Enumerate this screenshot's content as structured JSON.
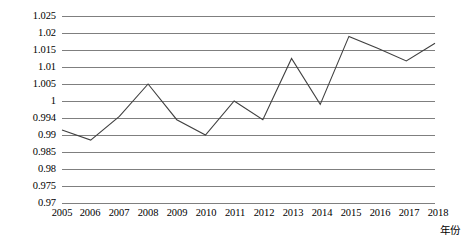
{
  "chart_data": {
    "type": "line",
    "title": "",
    "subtitle": "",
    "xlabel": "年份",
    "ylabel": "",
    "grid": true,
    "legend": false,
    "legend_position": "none",
    "line_color": "#404040",
    "gridline_color": "#7f7f7f",
    "background_color": "#ffffff",
    "categories": [
      "2005",
      "2006",
      "2007",
      "2008",
      "2009",
      "2010",
      "2011",
      "2012",
      "2013",
      "2014",
      "2015",
      "2016",
      "2017",
      "2018"
    ],
    "x": [
      2005,
      2006,
      2007,
      2008,
      2009,
      2010,
      2011,
      2012,
      2013,
      2014,
      2015,
      2016,
      2017,
      2018
    ],
    "values": [
      0.9915,
      0.9885,
      0.9955,
      1.005,
      0.9945,
      0.99,
      1.0,
      0.9945,
      1.0125,
      0.999,
      1.019,
      1.0155,
      1.0118,
      1.017
    ],
    "ytick_labels": [
      "1.025",
      "1.02",
      "1.015",
      "1.01",
      "1.005",
      "1",
      "0.994",
      "0.99",
      "0.985",
      "0.98",
      "0.975",
      "0.97"
    ],
    "ytick_values": [
      1.025,
      1.02,
      1.015,
      1.01,
      1.005,
      1.0,
      0.994,
      0.99,
      0.985,
      0.98,
      0.975,
      0.97
    ],
    "ylim": [
      0.97,
      1.025
    ],
    "xlim": [
      2005,
      2018
    ],
    "annotations": []
  }
}
